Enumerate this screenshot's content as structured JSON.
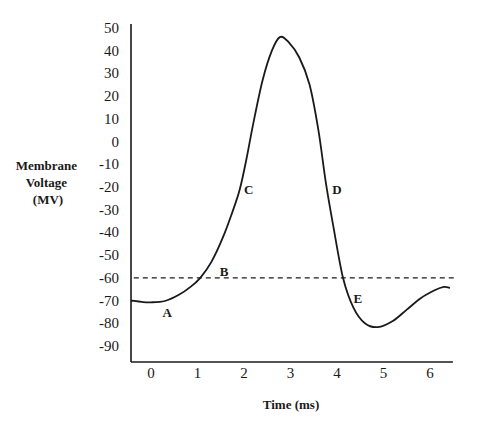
{
  "chart_data": {
    "type": "line",
    "title": "",
    "xlabel": "Time (ms)",
    "ylabel_lines": [
      "Membrane",
      "Voltage",
      "(MV)"
    ],
    "xlim": [
      -0.43,
      6.45
    ],
    "ylim": [
      -100,
      50
    ],
    "x_ticks": [
      0,
      1,
      2,
      3,
      4,
      5,
      6
    ],
    "x_tick_labels": [
      "0",
      "1",
      "2",
      "3",
      "4",
      "5",
      "6"
    ],
    "y_ticks": [
      50,
      40,
      30,
      20,
      10,
      0,
      -10,
      -20,
      -30,
      -40,
      -50,
      -60,
      -70,
      -80,
      -90
    ],
    "y_tick_labels": [
      "50",
      "40",
      "30",
      "20",
      "10",
      "0",
      "-10",
      "-20",
      "-30",
      "-40",
      "-50",
      "-60",
      "-70",
      "-80",
      "-90"
    ],
    "grid": false,
    "series": [
      {
        "name": "Membrane potential",
        "x": [
          -0.43,
          -0.2,
          0.0,
          0.3,
          0.6,
          0.85,
          1.06,
          1.3,
          1.55,
          1.75,
          1.91,
          2.05,
          2.2,
          2.4,
          2.6,
          2.77,
          2.95,
          3.19,
          3.41,
          3.6,
          3.76,
          3.91,
          4.13,
          4.35,
          4.6,
          4.88,
          5.2,
          5.5,
          5.8,
          6.1,
          6.3,
          6.43
        ],
        "y": [
          -70,
          -70.6,
          -70.8,
          -70.2,
          -67.5,
          -64,
          -60,
          -53,
          -42,
          -31,
          -21,
          -8,
          8,
          27,
          40,
          46,
          44,
          37,
          25,
          5,
          -18,
          -36,
          -60,
          -73,
          -80,
          -81.7,
          -79,
          -74,
          -69,
          -65.5,
          -64,
          -64.5
        ]
      }
    ],
    "threshold": {
      "value": -60,
      "style": "dashed",
      "x_range": [
        -0.37,
        6.55
      ]
    },
    "annotations": [
      {
        "text": "A",
        "x": 0.35,
        "y": -75
      },
      {
        "text": "B",
        "x": 1.57,
        "y": -57
      },
      {
        "text": "C",
        "x": 2.1,
        "y": -21
      },
      {
        "text": "D",
        "x": 4.0,
        "y": -21
      },
      {
        "text": "E",
        "x": 4.45,
        "y": -69
      }
    ]
  }
}
